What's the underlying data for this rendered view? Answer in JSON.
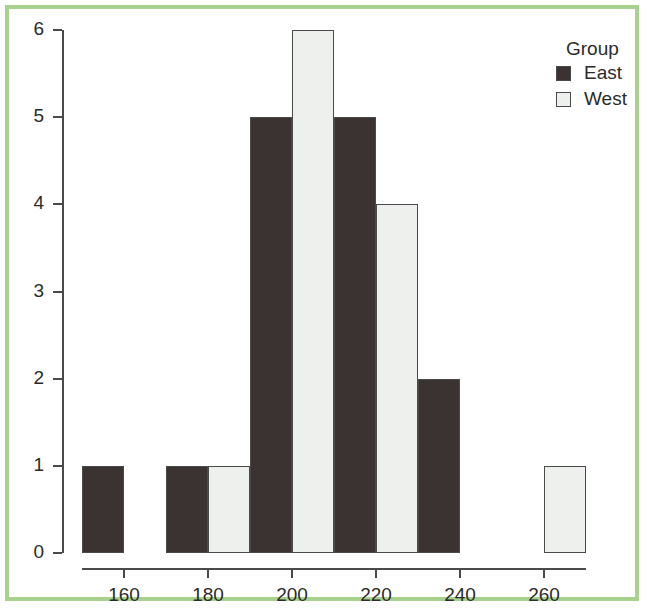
{
  "figure": {
    "border_color": "#a9d18e",
    "background": "#ffffff"
  },
  "legend": {
    "title": "Group",
    "entries": [
      {
        "label": "East",
        "color": "#3a3331"
      },
      {
        "label": "West",
        "color": "#eef0ee"
      }
    ]
  },
  "chart_data": {
    "type": "bar",
    "title": "",
    "xlabel": "",
    "ylabel": "",
    "categories": [
      "160",
      "180",
      "200",
      "220",
      "240",
      "260"
    ],
    "series": [
      {
        "name": "East",
        "values": [
          1,
          1,
          5,
          5,
          2,
          0
        ],
        "color": "#3a3331"
      },
      {
        "name": "West",
        "values": [
          0,
          1,
          6,
          4,
          0,
          1
        ],
        "color": "#eef0ee"
      }
    ],
    "ylim": [
      0,
      6
    ],
    "yticks": [
      "0",
      "1",
      "2",
      "3",
      "4",
      "5",
      "6"
    ],
    "xticks": [
      "160",
      "180",
      "200",
      "220",
      "240",
      "260"
    ],
    "grid": false,
    "legend_position": "top-right"
  }
}
